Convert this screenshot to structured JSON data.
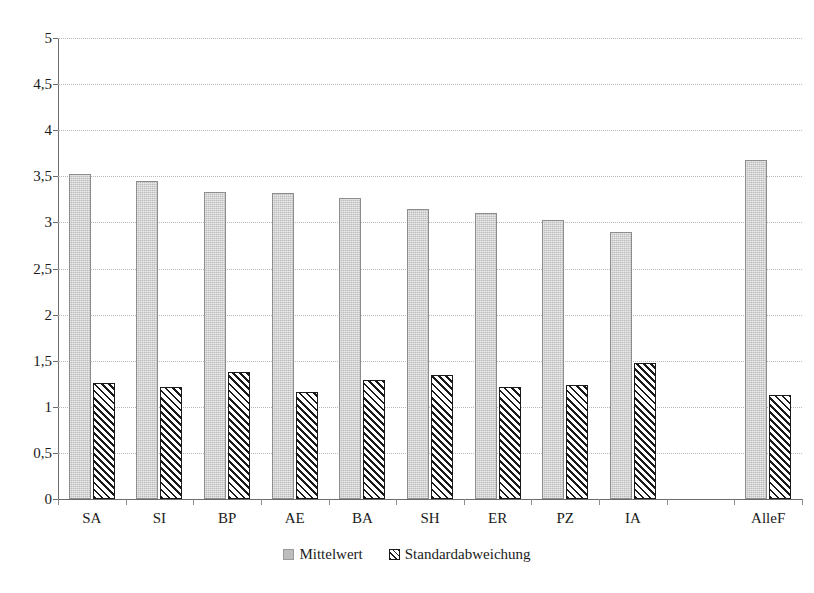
{
  "chart_data": {
    "type": "bar",
    "title": "",
    "xlabel": "",
    "ylabel": "",
    "ylim": [
      0,
      5
    ],
    "ytick_step": 0.5,
    "ytick_labels": [
      "5",
      "4,5",
      "4",
      "3,5",
      "3",
      "2,5",
      "2",
      "1,5",
      "1",
      "0,5",
      "0"
    ],
    "ytick_values": [
      5,
      4.5,
      4,
      3.5,
      3,
      2.5,
      2,
      1.5,
      1,
      0.5,
      0
    ],
    "grid": true,
    "legend_position": "bottom",
    "categories": [
      "SA",
      "SI",
      "BP",
      "AE",
      "BA",
      "SH",
      "ER",
      "PZ",
      "IA",
      "",
      "AlleF"
    ],
    "series": [
      {
        "name": "Mittelwert",
        "values": [
          3.53,
          3.45,
          3.33,
          3.32,
          3.26,
          3.15,
          3.1,
          3.03,
          2.9,
          null,
          3.68
        ]
      },
      {
        "name": "Standardabweichung",
        "values": [
          1.26,
          1.22,
          1.38,
          1.16,
          1.29,
          1.35,
          1.22,
          1.24,
          1.47,
          null,
          1.13
        ]
      }
    ],
    "colors": {
      "mean": "#bdbdbd",
      "sd_outline": "#1a1a1a",
      "sd_fill": "#ffffff",
      "gridline": "#b9b9b9",
      "axis": "#6b6b6b"
    }
  },
  "legend": {
    "items": [
      {
        "label": "Mittelwert",
        "marker": "filled-gray-square-icon"
      },
      {
        "label": "Standardabweichung",
        "marker": "hatched-square-icon"
      }
    ]
  }
}
